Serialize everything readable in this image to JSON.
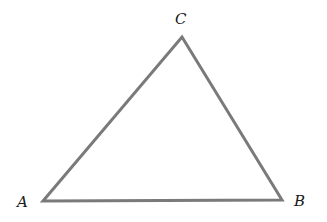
{
  "diagram": {
    "type": "triangle",
    "stroke_color": "#7a7a7a",
    "vertices": [
      {
        "name": "A",
        "label": "A",
        "x": 43,
        "y": 201
      },
      {
        "name": "B",
        "label": "B",
        "x": 282,
        "y": 200
      },
      {
        "name": "C",
        "label": "C",
        "x": 182,
        "y": 37
      }
    ]
  }
}
